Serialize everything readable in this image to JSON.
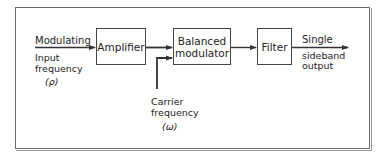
{
  "diagram": {
    "type": "block-diagram",
    "title": "",
    "blocks": [
      {
        "id": "amplifier",
        "label": "Amplifier"
      },
      {
        "id": "balanced-modulator",
        "label_line1": "Balanced",
        "label_line2": "modulator"
      },
      {
        "id": "filter",
        "label": "Filter"
      }
    ],
    "input": {
      "line1": "Modulating",
      "line2": "Input",
      "line3": "frequency",
      "symbol": "(ρ)"
    },
    "carrier": {
      "line1": "Carrier",
      "line2": "frequency",
      "symbol": "(ω)"
    },
    "output": {
      "line1": "Single",
      "line2": "sideband",
      "line3": "output"
    },
    "connections": [
      {
        "from": "input",
        "to": "amplifier"
      },
      {
        "from": "amplifier",
        "to": "balanced-modulator"
      },
      {
        "from": "carrier",
        "to": "balanced-modulator"
      },
      {
        "from": "balanced-modulator",
        "to": "filter"
      },
      {
        "from": "filter",
        "to": "output"
      }
    ],
    "colors": {
      "line": "#333333",
      "frame": "#6a6a6a",
      "background": "#ffffff"
    }
  }
}
